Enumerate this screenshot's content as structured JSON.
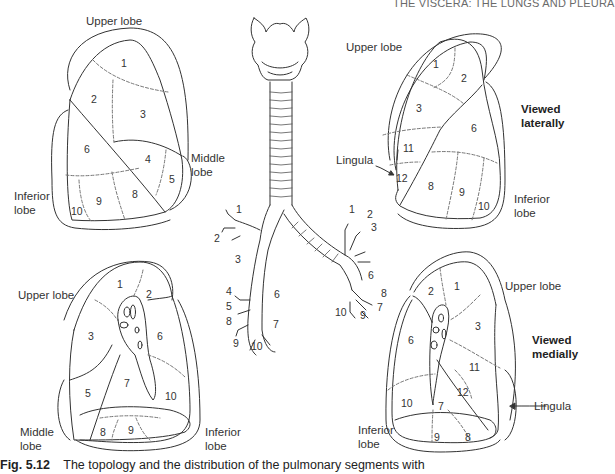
{
  "header": {
    "running_title": "THE VISCERA: THE LUNGS AND PLEURA"
  },
  "figure": {
    "caption_number": "Fig. 5.12",
    "caption_text": "The topology and the distribution of the pulmonary segments with"
  },
  "right_lung_lateral": {
    "lobe_labels": {
      "upper": "Upper lobe",
      "middle": "Middle\nlobe",
      "middle_l1": "Middle",
      "middle_l2": "lobe",
      "inferior_l1": "Inferior",
      "inferior_l2": "lobe"
    },
    "segments": [
      "1",
      "2",
      "3",
      "4",
      "5",
      "6",
      "8",
      "9",
      "10"
    ]
  },
  "left_lung_lateral": {
    "lobe_labels": {
      "upper": "Upper lobe",
      "lingula": "Lingula",
      "inferior_l1": "Inferior",
      "inferior_l2": "lobe"
    },
    "view_l1": "Viewed",
    "view_l2": "laterally",
    "segments": [
      "1",
      "2",
      "3",
      "6",
      "11",
      "12",
      "8",
      "9",
      "10"
    ]
  },
  "right_lung_medial": {
    "lobe_labels": {
      "upper": "Upper lobe",
      "middle_l1": "Middle",
      "middle_l2": "lobe",
      "inferior_l1": "Inferior",
      "inferior_l2": "lobe"
    },
    "segments": [
      "1",
      "2",
      "3",
      "6",
      "7",
      "5",
      "10",
      "8",
      "9"
    ]
  },
  "left_lung_medial": {
    "lobe_labels": {
      "upper": "Upper lobe",
      "lingula": "Lingula",
      "inferior_l1": "Inferior",
      "inferior_l2": "lobe"
    },
    "view_l1": "Viewed",
    "view_l2": "medially",
    "segments": [
      "2",
      "1",
      "6",
      "3",
      "11",
      "10",
      "7",
      "12",
      "9",
      "8"
    ]
  },
  "bronchial_tree": {
    "right_labels": [
      "1",
      "2",
      "3",
      "4",
      "6",
      "5",
      "8",
      "7",
      "9",
      "10"
    ],
    "left_labels": [
      "1",
      "2",
      "3",
      "6",
      "8",
      "7",
      "10",
      "9"
    ]
  }
}
